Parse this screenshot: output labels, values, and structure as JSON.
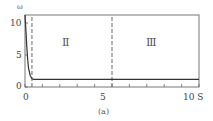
{
  "chart_data": {
    "type": "line",
    "title": "",
    "caption": "(a)",
    "xlabel": "S",
    "ylabel": "ω",
    "xlim": [
      0,
      10
    ],
    "ylim": [
      0,
      11
    ],
    "x_ticks": [
      0,
      5,
      10
    ],
    "x_tick_labels": [
      "0",
      "5",
      "10 S"
    ],
    "x_minor_ticks": [
      1,
      2,
      3,
      4,
      6,
      7,
      8,
      9
    ],
    "y_ticks": [
      0,
      5,
      10
    ],
    "y_tick_labels": [
      "0",
      "5",
      "10"
    ],
    "grid": false,
    "legend": null,
    "series": [
      {
        "name": "ω",
        "x": [
          0.0,
          0.05,
          0.1,
          0.15,
          0.2,
          0.3,
          0.4,
          0.5,
          1,
          2,
          5,
          10
        ],
        "y": [
          11.5,
          9.0,
          6.5,
          4.5,
          3.0,
          1.8,
          1.3,
          1.2,
          1.2,
          1.2,
          1.2,
          1.2
        ]
      }
    ],
    "vlines": [
      {
        "x": 0.4,
        "style": "dashed"
      },
      {
        "x": 5,
        "style": "dashed"
      }
    ],
    "annotations": [
      {
        "text": "Ⅱ",
        "x": 2.5,
        "y": 8.5
      },
      {
        "text": "Ⅲ",
        "x": 7.5,
        "y": 8.5
      }
    ]
  }
}
